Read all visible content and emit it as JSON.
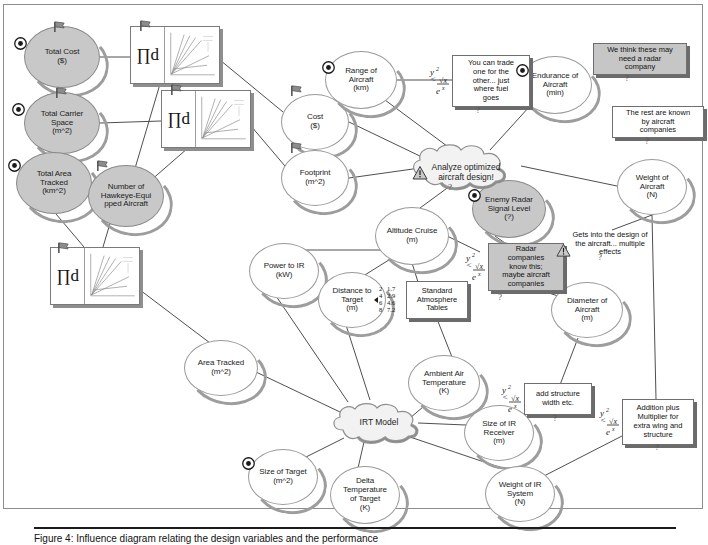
{
  "diagram": {
    "colors": {
      "shaded_node_fill": "#c8c8c8",
      "plain_node_fill": "#ffffff",
      "node_outline": "#9a9a9a",
      "shadow": "#9d9d9d",
      "note_border": "#6f6f6f",
      "shaded_note_fill": "#c6c6c6",
      "link": "#3a3a3a",
      "frame": "#8d8d8d"
    },
    "nodes": [
      {
        "id": "total-cost",
        "label": "Total Cost\n($)",
        "shaded": true,
        "bullseye": true,
        "flag": true,
        "x": 24,
        "y": 26,
        "w": 76,
        "h": 62
      },
      {
        "id": "total-carrier-space",
        "label": "Total Carrier\nSpace\n(m^2)",
        "shaded": true,
        "bullseye": true,
        "flag": true,
        "x": 24,
        "y": 92,
        "w": 76,
        "h": 62
      },
      {
        "id": "total-area-tracked",
        "label": "Total Area\nTracked\n(km^2)",
        "shaded": true,
        "bullseye": true,
        "flag": true,
        "x": 16,
        "y": 152,
        "w": 76,
        "h": 62
      },
      {
        "id": "number-hawkeye",
        "label": "Number of\nHawkeye-Equi\npped Aircraft",
        "shaded": true,
        "bullseye": false,
        "flag": true,
        "x": 88,
        "y": 165,
        "w": 76,
        "h": 62
      },
      {
        "id": "cost",
        "label": "Cost\n($)",
        "shaded": false,
        "bullseye": false,
        "flag": true,
        "x": 281,
        "y": 94,
        "w": 68,
        "h": 56
      },
      {
        "id": "footprint",
        "label": "Footprint\n(m^2)",
        "shaded": false,
        "bullseye": false,
        "flag": true,
        "x": 281,
        "y": 150,
        "w": 68,
        "h": 56
      },
      {
        "id": "range-of-aircraft",
        "label": "Range of\nAircraft\n(km)",
        "shaded": false,
        "bullseye": true,
        "flag": false,
        "x": 325,
        "y": 51,
        "w": 72,
        "h": 58
      },
      {
        "id": "endurance-of-aircraft",
        "label": "Endurance of\nAircraft\n(min)",
        "shaded": false,
        "bullseye": true,
        "flag": false,
        "x": 518,
        "y": 56,
        "w": 74,
        "h": 58
      },
      {
        "id": "weight-of-aircraft",
        "label": "Weight of\nAircraft\n(N)",
        "shaded": false,
        "bullseye": false,
        "flag": false,
        "x": 617,
        "y": 159,
        "w": 70,
        "h": 56
      },
      {
        "id": "enemy-radar",
        "label": "Enemy Radar\nSignal Level\n(?)",
        "shaded": true,
        "bullseye": true,
        "flag": false,
        "x": 472,
        "y": 180,
        "w": 74,
        "h": 58
      },
      {
        "id": "altitude-cruise",
        "label": "Altitude Cruise\n(m)",
        "shaded": false,
        "bullseye": false,
        "flag": false,
        "x": 375,
        "y": 207,
        "w": 74,
        "h": 58
      },
      {
        "id": "power-to-ir",
        "label": "Power to IR\n(kW)",
        "shaded": false,
        "bullseye": false,
        "flag": false,
        "x": 249,
        "y": 243,
        "w": 70,
        "h": 56
      },
      {
        "id": "distance-to-target",
        "label": "Distance to\nTarget\n(m)",
        "shaded": false,
        "bullseye": false,
        "flag": false,
        "x": 318,
        "y": 272,
        "w": 68,
        "h": 56
      },
      {
        "id": "diameter-of-aircraft",
        "label": "Diameter of\nAircraft\n(m)",
        "shaded": false,
        "bullseye": false,
        "flag": false,
        "x": 551,
        "y": 282,
        "w": 72,
        "h": 56
      },
      {
        "id": "area-tracked",
        "label": "Area Tracked\n(m^2)",
        "shaded": false,
        "bullseye": false,
        "flag": false,
        "x": 184,
        "y": 340,
        "w": 74,
        "h": 56
      },
      {
        "id": "ambient-air-temp",
        "label": "Ambient Air\nTemperature\n(K)",
        "shaded": false,
        "bullseye": false,
        "flag": false,
        "x": 408,
        "y": 355,
        "w": 72,
        "h": 56
      },
      {
        "id": "size-of-ir-receiver",
        "label": "Size of IR\nReceiver\n(m)",
        "shaded": false,
        "bullseye": false,
        "flag": false,
        "x": 464,
        "y": 405,
        "w": 70,
        "h": 56
      },
      {
        "id": "size-of-target",
        "label": "Size of Target\n(m^2)",
        "shaded": false,
        "bullseye": true,
        "flag": false,
        "x": 248,
        "y": 449,
        "w": 70,
        "h": 56
      },
      {
        "id": "delta-temp-of-target",
        "label": "Delta\nTemperature\nof Target\n(K)",
        "shaded": false,
        "bullseye": false,
        "flag": false,
        "x": 330,
        "y": 466,
        "w": 70,
        "h": 58
      },
      {
        "id": "weight-of-ir-system",
        "label": "Weight of IR\nSystem\n(N)",
        "shaded": false,
        "bullseye": false,
        "flag": false,
        "x": 485,
        "y": 466,
        "w": 70,
        "h": 56
      }
    ],
    "cloud": {
      "id": "analyze-optimized-aircraft-design",
      "label": "Analyze optimized\naircraft design!",
      "x": 406,
      "y": 141,
      "w": 116,
      "h": 50,
      "warn_icon": true
    },
    "irt_cloud": {
      "id": "irt-model",
      "label": "IRT Model",
      "x": 327,
      "y": 400,
      "w": 96,
      "h": 44
    },
    "notes": [
      {
        "id": "note-trade",
        "text": "You can trade\none for the\nother... just\nwhere fuel\ngoes",
        "x": 452,
        "y": 55,
        "w": 78,
        "h": 50,
        "shaded": false,
        "icon": "equation"
      },
      {
        "id": "note-radar-co",
        "text": "We think these may\nneed a radar\ncompany",
        "x": 593,
        "y": 43,
        "w": 94,
        "h": 32,
        "shaded": true,
        "icon": "none"
      },
      {
        "id": "note-rest",
        "text": "The rest are known\nby aircraft\ncompanies",
        "x": 612,
        "y": 106,
        "w": 92,
        "h": 32,
        "shaded": false,
        "icon": "none"
      },
      {
        "id": "note-design",
        "text": "Gets into the design of\nthe aircraft... multiple\neffects",
        "x": 558,
        "y": 228,
        "w": 104,
        "h": 32,
        "shaded": false,
        "icon": "warn"
      },
      {
        "id": "note-radar-kn",
        "text": "Radar\ncompanies\nknow this;\nmaybe aircraft\ncompanies",
        "x": 488,
        "y": 243,
        "w": 76,
        "h": 48,
        "shaded": true,
        "icon": "equation"
      },
      {
        "id": "note-atm",
        "text": "Standard\nAtmosphere\nTables",
        "x": 406,
        "y": 281,
        "w": 62,
        "h": 38,
        "shaded": false,
        "icon": "table"
      },
      {
        "id": "note-struct",
        "text": "add structure\nwidth etc.",
        "x": 524,
        "y": 383,
        "w": 68,
        "h": 32,
        "shaded": false,
        "icon": "equation"
      },
      {
        "id": "note-addition",
        "text": "Addition plus\nMultiplier for\nextra wing and\nstructure",
        "x": 622,
        "y": 399,
        "w": 72,
        "h": 46,
        "shaded": false,
        "icon": "equation"
      }
    ],
    "table_icon_values": [
      [
        "2",
        "1.7"
      ],
      [
        "4",
        "2.9"
      ],
      [
        "6",
        "4.6"
      ],
      [
        "8",
        "7.2"
      ]
    ],
    "graph_icons": [
      {
        "id": "graph-icon-1",
        "symbol": "∏d",
        "x": 130,
        "y": 26,
        "w": 90,
        "h": 58
      },
      {
        "id": "graph-icon-2",
        "symbol": "∏d",
        "x": 161,
        "y": 90,
        "w": 90,
        "h": 58
      },
      {
        "id": "graph-icon-3",
        "symbol": "∏d",
        "x": 50,
        "y": 247,
        "w": 90,
        "h": 58
      }
    ],
    "links": [
      [
        "total-cost",
        "graph-icon-1"
      ],
      [
        "total-carrier-space",
        "graph-icon-2"
      ],
      [
        "graph-icon-1",
        "number-hawkeye"
      ],
      [
        "graph-icon-2",
        "number-hawkeye"
      ],
      [
        "total-area-tracked",
        "graph-icon-3"
      ],
      [
        "graph-icon-3",
        "area-tracked"
      ],
      [
        "graph-icon-1",
        "cost"
      ],
      [
        "graph-icon-2",
        "footprint"
      ],
      [
        "cost",
        "analyze-optimized-aircraft-design"
      ],
      [
        "footprint",
        "analyze-optimized-aircraft-design"
      ],
      [
        "range-of-aircraft",
        "analyze-optimized-aircraft-design"
      ],
      [
        "range-of-aircraft",
        "note-trade"
      ],
      [
        "note-trade",
        "endurance-of-aircraft"
      ],
      [
        "endurance-of-aircraft",
        "analyze-optimized-aircraft-design"
      ],
      [
        "analyze-optimized-aircraft-design",
        "weight-of-aircraft"
      ],
      [
        "analyze-optimized-aircraft-design",
        "enemy-radar"
      ],
      [
        "analyze-optimized-aircraft-design",
        "altitude-cruise"
      ],
      [
        "enemy-radar",
        "note-radar-kn"
      ],
      [
        "note-radar-kn",
        "diameter-of-aircraft"
      ],
      [
        "weight-of-aircraft",
        "note-design"
      ],
      [
        "weight-of-aircraft",
        "note-addition"
      ],
      [
        "altitude-cruise",
        "power-to-ir"
      ],
      [
        "altitude-cruise",
        "distance-to-target"
      ],
      [
        "altitude-cruise",
        "note-atm"
      ],
      [
        "altitude-cruise",
        "note-radar-kn"
      ],
      [
        "note-atm",
        "ambient-air-temp"
      ],
      [
        "power-to-ir",
        "irt-model"
      ],
      [
        "distance-to-target",
        "irt-model"
      ],
      [
        "area-tracked",
        "irt-model"
      ],
      [
        "ambient-air-temp",
        "irt-model"
      ],
      [
        "irt-model",
        "size-of-ir-receiver"
      ],
      [
        "irt-model",
        "size-of-target"
      ],
      [
        "irt-model",
        "delta-temp-of-target"
      ],
      [
        "irt-model",
        "weight-of-ir-system"
      ],
      [
        "size-of-ir-receiver",
        "note-struct"
      ],
      [
        "weight-of-ir-system",
        "note-addition"
      ],
      [
        "diameter-of-aircraft",
        "note-struct"
      ]
    ]
  },
  "caption": {
    "text": "Figure 4: Influence diagram relating the design variables and the performance"
  }
}
